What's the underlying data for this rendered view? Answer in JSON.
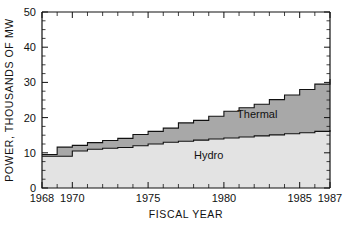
{
  "chart_data": {
    "type": "area",
    "subtype": "stacked-step",
    "title": "",
    "xlabel": "FISCAL YEAR",
    "ylabel": "POWER, THOUSANDS OF MW",
    "xlim": [
      1968,
      1987
    ],
    "ylim": [
      0,
      50
    ],
    "grid": false,
    "legend_position": "inline-annotation",
    "x": [
      1968,
      1969,
      1970,
      1971,
      1972,
      1973,
      1974,
      1975,
      1976,
      1977,
      1978,
      1979,
      1980,
      1981,
      1982,
      1983,
      1984,
      1985,
      1986,
      1987
    ],
    "x_tick_labels": [
      "1968",
      "1970",
      "1975",
      "1980",
      "1985",
      "1987"
    ],
    "x_tick_values": [
      1968,
      1970,
      1975,
      1980,
      1985,
      1987
    ],
    "y_tick_labels": [
      "0",
      "10",
      "20",
      "30",
      "40",
      "50"
    ],
    "y_tick_values": [
      0,
      10,
      20,
      30,
      40,
      50
    ],
    "y_minor_step": 2.5,
    "series": [
      {
        "name": "Hydro",
        "color": "#e3e3e3",
        "label": "Hydro",
        "values": [
          9.0,
          9.0,
          10.5,
          11.0,
          11.3,
          11.5,
          12.0,
          12.5,
          13.0,
          13.3,
          13.6,
          13.9,
          14.2,
          14.5,
          14.8,
          15.1,
          15.4,
          15.7,
          16.1,
          16.5
        ]
      },
      {
        "name": "Thermal",
        "color": "#a8a8a8",
        "label": "Thermal",
        "values": [
          0.5,
          2.6,
          1.6,
          1.9,
          2.2,
          2.6,
          3.2,
          3.6,
          4.0,
          5.2,
          5.6,
          6.5,
          7.6,
          8.3,
          9.0,
          10.0,
          11.0,
          12.3,
          13.4,
          14.5
        ]
      }
    ],
    "totals": [
      9.5,
      11.6,
      12.1,
      12.9,
      13.5,
      14.1,
      15.2,
      16.1,
      17.0,
      18.5,
      19.2,
      20.4,
      21.8,
      22.8,
      23.8,
      25.1,
      26.4,
      28.0,
      29.5,
      31.0
    ],
    "annotations": [
      {
        "text": "Thermal",
        "x": 1982.2,
        "y": 19.8
      },
      {
        "text": "Hydro",
        "x": 1979.0,
        "y": 8.2
      }
    ],
    "colors": {
      "hydro": "#e3e3e3",
      "thermal": "#a8a8a8",
      "axis": "#111111",
      "background": "#ffffff"
    }
  }
}
